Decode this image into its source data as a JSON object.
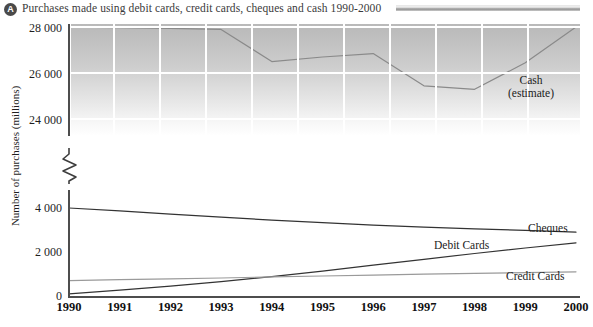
{
  "header": {
    "badge": "A",
    "title": "Purchases made using debit cards, credit cards, cheques and cash 1990-2000",
    "rule_color": "#8e8e8e"
  },
  "annotations": {
    "cash_line1": "Cash",
    "cash_line2": "(estimate)",
    "cheques": "Cheques",
    "debit": "Debit Cards",
    "credit": "Credit Cards"
  },
  "axis": {
    "ylabel": "Number of purchases (millions)",
    "upper_ticks": [
      "28 000",
      "26 000",
      "24 000"
    ],
    "lower_ticks": [
      "4 000",
      "2 000",
      "0"
    ],
    "break_marker": "axis-break-zigzag"
  },
  "chart_data": {
    "type": "line",
    "title": "Purchases made using debit cards, credit cards, cheques and cash 1990-2000",
    "xlabel": "",
    "ylabel": "Number of purchases (millions)",
    "grid": true,
    "legend_position": "inline-right",
    "broken_axis": true,
    "upper_ylim": [
      23200,
      28200
    ],
    "lower_ylim": [
      0,
      4650
    ],
    "upper_yticks": [
      24000,
      26000,
      28000
    ],
    "lower_yticks": [
      0,
      2000,
      4000
    ],
    "categories": [
      1990,
      1991,
      1992,
      1993,
      1994,
      1995,
      1996,
      1997,
      1998,
      1999,
      2000
    ],
    "series": [
      {
        "name": "Cash (estimate)",
        "panel": "upper",
        "color": "#8a8a8a",
        "values": [
          27950,
          27930,
          27900,
          27850,
          26450,
          26650,
          26800,
          25400,
          25250,
          26400,
          27950
        ]
      },
      {
        "name": "Cheques",
        "panel": "lower",
        "color": "#333333",
        "values": [
          4000,
          3870,
          3720,
          3580,
          3450,
          3330,
          3220,
          3130,
          3050,
          2980,
          2900
        ]
      },
      {
        "name": "Debit Cards",
        "panel": "lower",
        "color": "#333333",
        "values": [
          100,
          270,
          450,
          650,
          880,
          1130,
          1400,
          1670,
          1930,
          2180,
          2420
        ]
      },
      {
        "name": "Credit Cards",
        "panel": "lower",
        "color": "#9a9a9a",
        "values": [
          700,
          740,
          780,
          820,
          870,
          910,
          950,
          990,
          1030,
          1065,
          1100
        ]
      }
    ]
  }
}
